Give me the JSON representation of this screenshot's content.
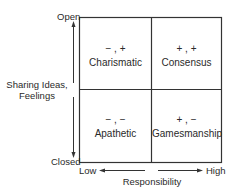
{
  "diagram": {
    "type": "2x2-matrix",
    "y_axis": {
      "label_line1": "Sharing Ideas,",
      "label_line2": "Feelings",
      "top": "Open",
      "bottom": "Closed"
    },
    "x_axis": {
      "label": "Responsibility",
      "left": "Low",
      "right": "High"
    },
    "quadrants": [
      {
        "position": "top-left",
        "symbol": "− , +",
        "label": "Charismatic"
      },
      {
        "position": "top-right",
        "symbol": "+ , +",
        "label": "Consensus"
      },
      {
        "position": "bottom-left",
        "symbol": "− , −",
        "label": "Apathetic"
      },
      {
        "position": "bottom-right",
        "symbol": "+ , −",
        "label": "Gamesmanship"
      }
    ],
    "colors": {
      "line": "#333333",
      "text": "#2a2a2a",
      "background": "#ffffff"
    }
  }
}
